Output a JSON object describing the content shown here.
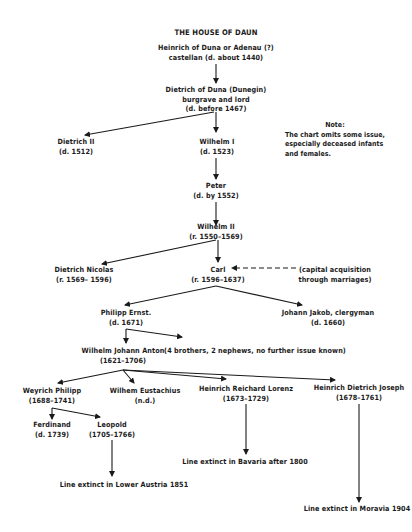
{
  "title": "THE HOUSE OF DAUN",
  "nodes": {
    "heinrich": {
      "line1": "Heinrich of Duna or Adenau (?)",
      "line2": "castellan (d. about 1440)"
    },
    "dietrich": {
      "line1": "Dietrich of Duna (Dunegin)",
      "line2": "burgrave and lord",
      "line3": "(d. before 1467)"
    },
    "dietrich2": {
      "line1": "Dietrich II",
      "line2": "(d. 1512)"
    },
    "wilhelm1": {
      "line1": "Wilhelm I",
      "line2": "(d. 1523)"
    },
    "peter": {
      "line1": "Peter",
      "line2": "(d. by 1552)"
    },
    "wilhelm2": {
      "line1": "Wilhelm II",
      "line2": "(r. 1550–1569)"
    },
    "dietrich_nicolas": {
      "line1": "Dietrich Nicolas",
      "line2": "(r. 1569– 1596)"
    },
    "carl": {
      "line1": "Carl",
      "line2": "(r. 1596–1637)"
    },
    "capital": {
      "line1": "(capital acquisition",
      "line2": "through marriages)"
    },
    "philipp": {
      "line1": "Philipp Ernst.",
      "line2": "(d. 1671)"
    },
    "johann": {
      "line1": "Johann Jakob, clergyman",
      "line2": "(d. 1660)"
    },
    "wilhelm_johann": {
      "line1": "Wilhelm Johann Anton",
      "line2": "(1621–1706)"
    },
    "brothers": {
      "line1": "(4 brothers, 2 nephews, no further issue known)"
    },
    "weyrich": {
      "line1": "Weyrich Philipp",
      "line2": "(1688–1741)"
    },
    "wilhem_eust": {
      "line1": "Wilhem Eustachius",
      "line2": "(n.d.)"
    },
    "heinrich_rl": {
      "line1": "Heinrich Reichard Lorenz",
      "line2": "(1673–1729)"
    },
    "heinrich_dj": {
      "line1": "Heinrich Dietrich Joseph",
      "line2": "(1678–1761)"
    },
    "ferdinand": {
      "line1": "Ferdinand",
      "line2": "(d. 1739)"
    },
    "leopold": {
      "line1": "Leopold",
      "line2": "(1705–1766)"
    },
    "extinct_austria": {
      "line1": "Line extinct in Lower Austria 1851"
    },
    "extinct_bavaria": {
      "line1": "Line extinct in Bavaria after 1800"
    },
    "extinct_moravia": {
      "line1": "Line extinct in Moravia 1904"
    }
  },
  "note": {
    "heading": "Note:",
    "line1": "The chart omits some issue,",
    "line2": "especially deceased infants",
    "line3": "and females."
  }
}
